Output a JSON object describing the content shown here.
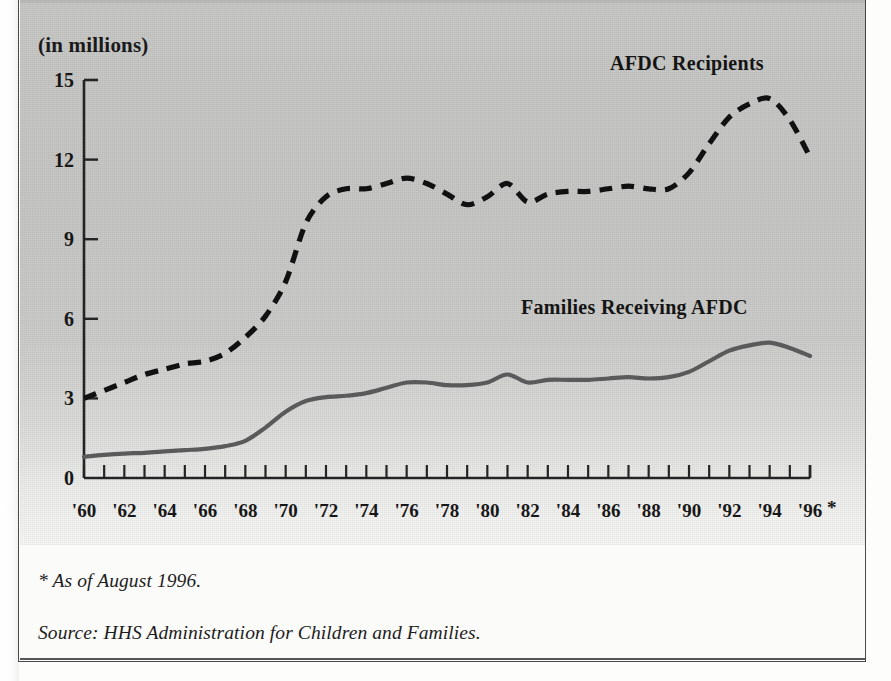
{
  "chart_data": {
    "type": "line",
    "title": "",
    "subtitle": "",
    "units_label": "(in millions)",
    "xlabel": "",
    "ylabel": "(in millions)",
    "ylim": [
      0,
      15
    ],
    "xlim": [
      1960,
      1996
    ],
    "grid": false,
    "legend_position": "inline-annotations",
    "ytick_labels": [
      "15",
      "12",
      "9",
      "6",
      "3",
      "0"
    ],
    "ytick_values": [
      15,
      12,
      9,
      6,
      3,
      0
    ],
    "xtick_labels": [
      "'60",
      "'62",
      "'64",
      "'66",
      "'68",
      "'70",
      "'72",
      "'74",
      "'76",
      "'78",
      "'80",
      "'82",
      "'84",
      "'86",
      "'88",
      "'90",
      "'92",
      "'94",
      "'96"
    ],
    "xtick_values": [
      1960,
      1962,
      1964,
      1966,
      1968,
      1970,
      1972,
      1974,
      1976,
      1978,
      1980,
      1982,
      1984,
      1986,
      1988,
      1990,
      1992,
      1994,
      1996
    ],
    "xtick_star": "*",
    "minor_ticks_every_year": true,
    "x": [
      1960,
      1961,
      1962,
      1963,
      1964,
      1965,
      1966,
      1967,
      1968,
      1969,
      1970,
      1971,
      1972,
      1973,
      1974,
      1975,
      1976,
      1977,
      1978,
      1979,
      1980,
      1981,
      1982,
      1983,
      1984,
      1985,
      1986,
      1987,
      1988,
      1989,
      1990,
      1991,
      1992,
      1993,
      1994,
      1995,
      1996
    ],
    "series": [
      {
        "name": "AFDC Recipients",
        "style": "dashed",
        "color": "#111111",
        "values": [
          3.0,
          3.3,
          3.6,
          3.9,
          4.1,
          4.3,
          4.4,
          4.7,
          5.3,
          6.1,
          7.4,
          9.6,
          10.6,
          10.9,
          10.9,
          11.1,
          11.3,
          11.1,
          10.7,
          10.3,
          10.6,
          11.1,
          10.4,
          10.7,
          10.8,
          10.8,
          10.9,
          11.0,
          10.9,
          10.9,
          11.5,
          12.6,
          13.6,
          14.1,
          14.3,
          13.5,
          12.1
        ]
      },
      {
        "name": "Families Receiving AFDC",
        "style": "solid",
        "color": "#5a5a5a",
        "values": [
          0.8,
          0.87,
          0.92,
          0.95,
          1.0,
          1.05,
          1.1,
          1.2,
          1.4,
          1.9,
          2.5,
          2.9,
          3.05,
          3.1,
          3.2,
          3.4,
          3.6,
          3.6,
          3.5,
          3.5,
          3.6,
          3.9,
          3.6,
          3.7,
          3.7,
          3.7,
          3.75,
          3.8,
          3.75,
          3.8,
          4.0,
          4.4,
          4.8,
          5.0,
          5.1,
          4.9,
          4.6
        ]
      }
    ],
    "annotations": [
      {
        "text": "AFDC Recipients",
        "anchor": "upper-right"
      },
      {
        "text": "Families Receiving AFDC",
        "anchor": "middle-right"
      }
    ],
    "footnotes": [
      "* As of August 1996.",
      "Source: HHS Administration for Children and Families."
    ]
  },
  "chart": {
    "units_label": "(in millions)",
    "series_label_recipients": "AFDC Recipients",
    "series_label_families": "Families Receiving AFDC",
    "xtick_star": "*"
  },
  "footer": {
    "asof": "* As of August 1996.",
    "source": "Source: HHS Administration for Children and Families."
  },
  "colors": {
    "panel_gray": "#c9c9c7",
    "recipients_line": "#111111",
    "families_line": "#5a5a5a",
    "axis": "#222222",
    "text": "#171717"
  }
}
